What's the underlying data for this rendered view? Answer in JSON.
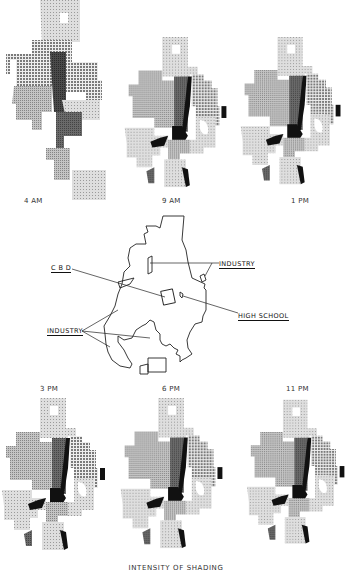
{
  "figure": {
    "panels": [
      {
        "id": "4am",
        "label": "4 AM"
      },
      {
        "id": "9am",
        "label": "9 AM"
      },
      {
        "id": "1pm",
        "label": "1 PM"
      },
      {
        "id": "3pm",
        "label": "3 PM"
      },
      {
        "id": "6pm",
        "label": "6 PM"
      },
      {
        "id": "11pm",
        "label": "11 PM"
      }
    ],
    "key_map": {
      "callouts": {
        "cbd": "C B D",
        "industry_top": "INDUSTRY",
        "high_school": "HIGH SCHOOL",
        "industry_left": "INDUSTRY"
      }
    },
    "legend_title": "INTENSITY OF SHADING"
  },
  "colors": {
    "light": "#c9c9c9",
    "medium": "#a4a4a4",
    "dark": "#6e6e6e",
    "darkest": "#3c3c3c",
    "black": "#111111",
    "outline": "#222222"
  }
}
